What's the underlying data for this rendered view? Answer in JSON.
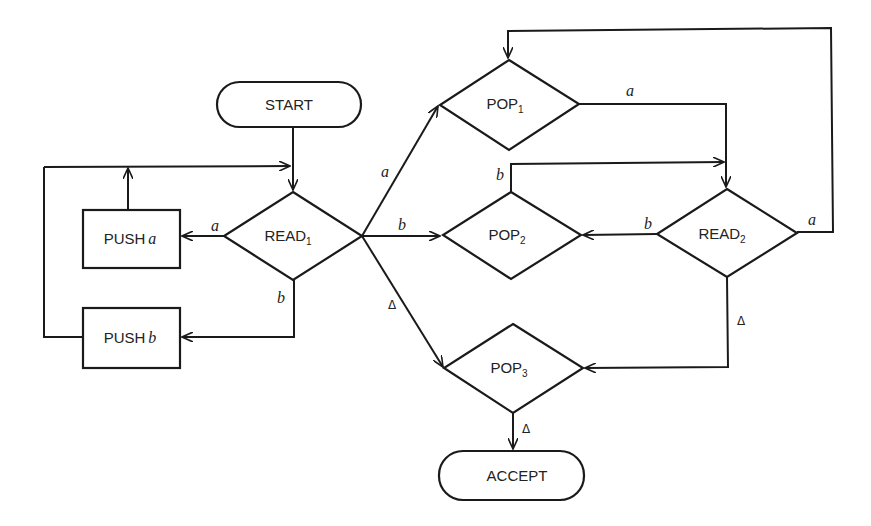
{
  "diagram": {
    "type": "flowchart",
    "nodes": {
      "start": {
        "label": "START",
        "shape": "rounded"
      },
      "read1": {
        "label": "READ",
        "sub": "1",
        "shape": "diamond"
      },
      "push_a": {
        "label": "PUSH",
        "var": "a",
        "shape": "rect"
      },
      "push_b": {
        "label": "PUSH",
        "var": "b",
        "shape": "rect"
      },
      "pop1": {
        "label": "POP",
        "sub": "1",
        "shape": "diamond"
      },
      "pop2": {
        "label": "POP",
        "sub": "2",
        "shape": "diamond"
      },
      "pop3": {
        "label": "POP",
        "sub": "3",
        "shape": "diamond"
      },
      "read2": {
        "label": "READ",
        "sub": "2",
        "shape": "diamond"
      },
      "accept": {
        "label": "ACCEPT",
        "shape": "rounded"
      }
    },
    "edge_labels": {
      "read1_push_a": "a",
      "read1_push_b": "b",
      "read1_pop1": "a",
      "read1_pop2": "b",
      "read1_pop3": "Δ",
      "pop1_read2": "a",
      "pop2_read2": "b",
      "read2_pop2": "b",
      "read2_pop1": "a",
      "read2_pop3": "Δ",
      "pop3_accept": "Δ"
    },
    "edges": [
      {
        "from": "START",
        "to": "READ1"
      },
      {
        "from": "READ1",
        "to": "PUSH a",
        "label": "a"
      },
      {
        "from": "READ1",
        "to": "PUSH b",
        "label": "b"
      },
      {
        "from": "PUSH a",
        "to": "READ1"
      },
      {
        "from": "PUSH b",
        "to": "READ1"
      },
      {
        "from": "READ1",
        "to": "POP1",
        "label": "a"
      },
      {
        "from": "READ1",
        "to": "POP2",
        "label": "b"
      },
      {
        "from": "READ1",
        "to": "POP3",
        "label": "Δ"
      },
      {
        "from": "POP1",
        "to": "READ2",
        "label": "a"
      },
      {
        "from": "POP2",
        "to": "READ2",
        "label": "b"
      },
      {
        "from": "READ2",
        "to": "POP2",
        "label": "b"
      },
      {
        "from": "READ2",
        "to": "POP1",
        "label": "a"
      },
      {
        "from": "READ2",
        "to": "POP3",
        "label": "Δ"
      },
      {
        "from": "POP3",
        "to": "ACCEPT",
        "label": "Δ"
      }
    ]
  }
}
